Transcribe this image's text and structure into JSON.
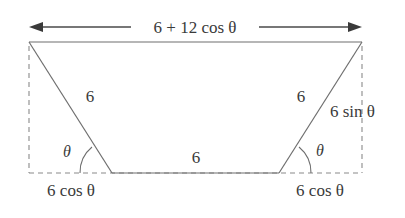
{
  "figure": {
    "type": "geometry-diagram",
    "shape": "trapezoid",
    "stroke_color": "#6e6e6e",
    "dash_color": "#8a8a8a",
    "text_color": "#3a3a3a",
    "background": "#ffffff"
  },
  "labels": {
    "top_width": "6 + 12 cos θ",
    "left_leg": "6",
    "right_leg": "6",
    "bottom_base": "6",
    "right_height": "6 sin θ",
    "bottom_left_offset": "6 cos θ",
    "bottom_right_offset": "6 cos θ",
    "angle_left": "θ",
    "angle_right": "θ"
  },
  "geometry": {
    "top_left": [
      29,
      42
    ],
    "top_right": [
      362,
      42
    ],
    "bottom_left": [
      112,
      173
    ],
    "bottom_right": [
      279,
      173
    ],
    "dash_bottom_left": [
      29,
      173
    ],
    "dash_bottom_right": [
      362,
      173
    ],
    "arrow_y": 27,
    "arrow_x_start": 29,
    "arrow_x_end": 362
  },
  "measurements": {
    "leg_length": 6,
    "base_length": 6,
    "top_length_expression": "6 + 12 cos θ",
    "height_expression": "6 sin θ",
    "horizontal_offset_expression": "6 cos θ",
    "base_angle_symbol": "θ"
  }
}
